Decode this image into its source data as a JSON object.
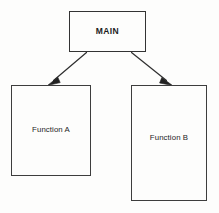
{
  "diagram": {
    "type": "hierarchy-flow-diagram",
    "background_color": "#fdfdfc",
    "stroke_color": "#333333",
    "text_color": "#1c1c1c",
    "nodes": [
      {
        "id": "main",
        "label": "MAIN",
        "role": "root",
        "bold": true
      },
      {
        "id": "function-a",
        "label": "Function A",
        "role": "child",
        "bold": false
      },
      {
        "id": "function-b",
        "label": "Function B",
        "role": "child",
        "bold": false
      }
    ],
    "connectors": [
      {
        "id": "main-to-function-a",
        "from": "main",
        "to": "function-a",
        "arrowhead": "filled-triangle",
        "direction": "down-left"
      },
      {
        "id": "main-to-function-b",
        "from": "main",
        "to": "function-b",
        "arrowhead": "filled-triangle",
        "direction": "down-right"
      }
    ]
  }
}
